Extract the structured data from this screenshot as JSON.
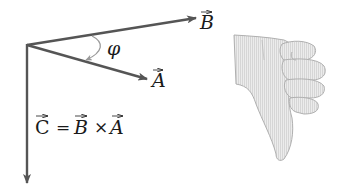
{
  "diagram": {
    "vectors": [
      {
        "name": "B",
        "label": "B",
        "from": [
          27,
          45
        ],
        "to": [
          196,
          18
        ]
      },
      {
        "name": "A",
        "label": "A",
        "from": [
          27,
          45
        ],
        "to": [
          147,
          79
        ]
      },
      {
        "name": "C",
        "label": "C",
        "from": [
          27,
          45
        ],
        "to": [
          27,
          183
        ]
      }
    ],
    "angle_label": "φ",
    "equation": {
      "lhs": "C",
      "equals": "=",
      "term1": "B",
      "times": "×",
      "term2": "A"
    },
    "hand_icon": "thumbs-down-hand (right-hand rule illustration)",
    "colors": {
      "vector": "#555555",
      "arc": "#9a9a9a",
      "text": "#1a1a1a",
      "hand_fill": "#e4e4e4",
      "hand_stroke": "#b0b0b0"
    }
  }
}
